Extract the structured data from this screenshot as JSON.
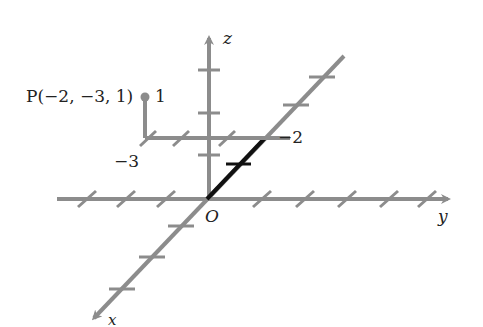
{
  "diagram": {
    "type": "3d-coordinate-axes",
    "labels": {
      "z_axis": "z",
      "y_axis": "y",
      "x_axis": "x",
      "origin": "O",
      "point": "P(−2, −3, 1)",
      "z_value": "1",
      "y_value": "−3",
      "x_value": "−2"
    },
    "point": {
      "name": "P",
      "x": -2,
      "y": -3,
      "z": 1
    },
    "colors": {
      "axis": "#8c8c8c",
      "highlight": "#111111",
      "text": "#222222"
    }
  }
}
